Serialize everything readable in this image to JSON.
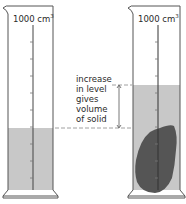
{
  "diagram": {
    "left_cylinder": {
      "capacity_label": "1000 cm",
      "capacity_unit_sup": "3",
      "state": "liquid only"
    },
    "right_cylinder": {
      "capacity_label": "1000 cm",
      "capacity_unit_sup": "3",
      "state": "liquid with submerged solid"
    },
    "annotation": {
      "lines": [
        "increase",
        "in level",
        "gives",
        "volume",
        "of solid"
      ]
    },
    "colors": {
      "outline": "#555555",
      "liquid": "#c8c8c8",
      "solid": "#555555",
      "dashed": "#888888"
    }
  }
}
